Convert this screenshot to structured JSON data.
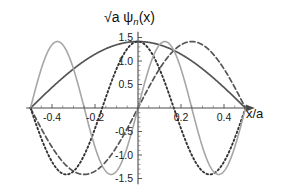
{
  "figure": {
    "title": "√a ψ",
    "title_sub": "n",
    "title_tail": "(x)",
    "x_axis_label": "x/a",
    "background_color": "#ffffff",
    "axis_color": "#4a4a4a"
  },
  "chart_data": {
    "type": "line",
    "xlabel": "x/a",
    "ylabel": "√a ψₙ(x)",
    "xlim": [
      -0.52,
      0.52
    ],
    "ylim": [
      -1.62,
      1.62
    ],
    "grid": false,
    "legend": "none",
    "x_ticks": [
      -0.4,
      -0.2,
      0.2,
      0.4
    ],
    "x_tick_labels": [
      "-0.4",
      "-0.2",
      "0.2",
      "0.4"
    ],
    "x_minor_ticks": [
      -0.45,
      -0.35,
      -0.3,
      -0.25,
      -0.15,
      -0.1,
      -0.05,
      0.05,
      0.1,
      0.15,
      0.25,
      0.3,
      0.35,
      0.45
    ],
    "y_ticks": [
      1.5,
      1.0,
      0.5,
      -0.5,
      -1.0,
      -1.5
    ],
    "y_tick_labels": [
      "1.5",
      "1.0",
      "0.5",
      "-0.5",
      "-1.0",
      "-1.5"
    ],
    "y_minor_ticks": [
      -1.4,
      -1.3,
      -1.2,
      -1.1,
      -0.9,
      -0.8,
      -0.7,
      -0.6,
      -0.4,
      -0.3,
      -0.2,
      -0.1,
      0.1,
      0.2,
      0.3,
      0.4,
      0.6,
      0.7,
      0.8,
      0.9,
      1.1,
      1.2,
      1.3,
      1.4
    ],
    "amplitude": 1.414,
    "well_width": 1.0,
    "series": [
      {
        "name": "n=1",
        "n": 1,
        "formula": "sqrt(2) cos(pi x)",
        "color": "#555555",
        "style": "solid",
        "width": 1.7,
        "dasharray": "",
        "peak": 1.414,
        "peak_x": 0.0
      },
      {
        "name": "n=2",
        "n": 2,
        "formula": "sqrt(2) sin(2 pi x)",
        "color": "#555555",
        "style": "dashed",
        "width": 1.7,
        "dasharray": "5,3",
        "peak": 1.414,
        "peak_x": 0.25
      },
      {
        "name": "n=3",
        "n": 3,
        "formula": "sqrt(2) cos(3 pi x)",
        "color": "#333333",
        "style": "dotted",
        "width": 1.9,
        "dasharray": "1.6,2.6",
        "peak": 1.414,
        "peak_x": 0.0
      },
      {
        "name": "n=4",
        "n": 4,
        "formula": "sqrt(2) sin(4 pi x)",
        "color": "#a6a6a6",
        "style": "solid",
        "width": 1.6,
        "dasharray": "",
        "peak": 1.414,
        "peak_x": 0.125
      }
    ]
  }
}
